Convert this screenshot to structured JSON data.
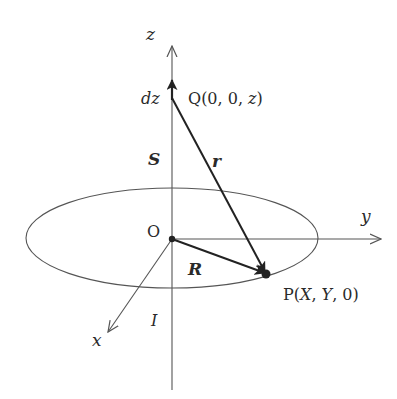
{
  "diagram": {
    "axes": {
      "z_label": "z",
      "y_label": "y",
      "x_label": "x"
    },
    "points": {
      "origin_label": "O",
      "q_label": "Q(0, 0, z)",
      "q_prefix": "Q",
      "q_coords_open": "(0, 0, ",
      "q_coords_var": "z",
      "q_coords_close": ")",
      "p_prefix": "P",
      "p_open": "(",
      "p_x": "X",
      "p_sep1": ", ",
      "p_y": "Y",
      "p_sep2": ", 0)",
      "p_label": "P(X, Y, 0)"
    },
    "vectors": {
      "S_label": "S",
      "r_label": "r",
      "R_label": "R",
      "dz_label": "dz"
    },
    "current": {
      "I_label": "I"
    },
    "colors": {
      "stroke": "#333333",
      "axis": "#555555",
      "vector": "#222222"
    }
  }
}
